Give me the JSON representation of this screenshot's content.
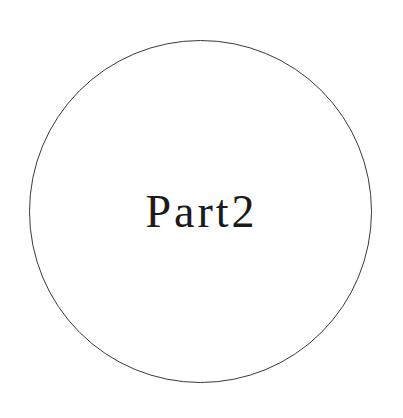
{
  "title": "Part2",
  "shape": "circle",
  "colors": {
    "background": "#ffffff",
    "stroke": "#3a3a3a",
    "text": "#1a1a1a"
  }
}
